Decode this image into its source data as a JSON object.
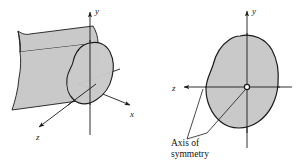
{
  "figure": {
    "background_color": "#ffffff",
    "line_color": "#1a1a1a",
    "fill_gray": "#c9c9c9",
    "fill_gray_dark": "#bdbdbd"
  },
  "left_panel": {
    "name": "three-dimensional prismatic body",
    "axes": [
      {
        "id": "y",
        "label": "y",
        "direction": "up"
      },
      {
        "id": "x",
        "label": "x",
        "direction": "right-down"
      },
      {
        "id": "z",
        "label": "z",
        "direction": "left-down"
      }
    ]
  },
  "right_panel": {
    "name": "cross-section view",
    "axes": [
      {
        "id": "y",
        "label": "y",
        "direction": "up"
      },
      {
        "id": "z",
        "label": "z",
        "direction": "left"
      }
    ],
    "origin_marker": "o",
    "annotation": {
      "line1": "Axis of",
      "line2": "symmetry",
      "leader_count": 2
    }
  }
}
